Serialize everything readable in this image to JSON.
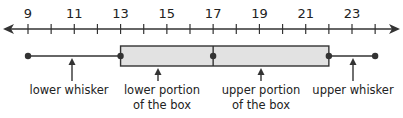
{
  "diagram": {
    "title": "",
    "type": "box-and-whisker-plot",
    "number_line": {
      "min_visible": 8,
      "max_visible": 25,
      "labeled_ticks": [
        9,
        11,
        13,
        15,
        17,
        19,
        21,
        23
      ],
      "unit_ticks": [
        9,
        10,
        11,
        12,
        13,
        14,
        15,
        16,
        17,
        18,
        19,
        20,
        21,
        22,
        23,
        24
      ],
      "arrow_both_ends": true
    },
    "box_plot": {
      "minimum": 9,
      "lower_quartile": 13,
      "median": 17,
      "upper_quartile": 22,
      "maximum": 24
    },
    "labels": {
      "lower_whisker": "lower whisker",
      "lower_box_line1": "lower portion",
      "lower_box_line2": "of the box",
      "upper_box_line1": "upper portion",
      "upper_box_line2": "of the box",
      "upper_whisker": "upper whisker"
    },
    "colors": {
      "line": "#333333",
      "box_fill": "#e2e2e2",
      "text": "#222222"
    }
  },
  "chart_data": {
    "type": "box",
    "title": "",
    "xlabel": "",
    "ylabel": "",
    "xlim": [
      8,
      25
    ],
    "tick_labels": [
      "9",
      "11",
      "13",
      "15",
      "17",
      "19",
      "21",
      "23"
    ],
    "five_number_summary": {
      "min": 9,
      "q1": 13,
      "median": 17,
      "q3": 22,
      "max": 24
    },
    "annotations": [
      "lower whisker",
      "lower portion of the box",
      "upper portion of the box",
      "upper whisker"
    ]
  }
}
